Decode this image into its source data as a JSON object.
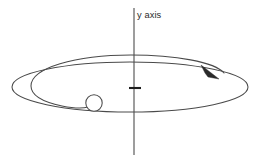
{
  "figure": {
    "background_color": "#ffffff",
    "width": 261,
    "height": 160,
    "labels": {
      "y_axis": "y axis"
    },
    "colors": {
      "axis": "#555555",
      "orbit": "#4a4a4a",
      "arrow": "#2a2a2a",
      "tick": "#1d1d1d",
      "ball_fill": "#ffffff",
      "text": "#2b2b2b"
    },
    "elements": {
      "y_axis_line": {
        "name": "y axis",
        "x": 134,
        "y_top": 8,
        "y_bottom": 155
      },
      "origin_tick": {
        "name": "origin tick mark",
        "x_start": 129,
        "x_end": 141,
        "y": 88
      },
      "outer_orbit": {
        "name": "outer orbit ellipse",
        "center_x": 130,
        "center_y": 87,
        "radius_x": 118,
        "radius_y": 25
      },
      "inner_orbit": {
        "name": "inner spiral orbit",
        "center_x": 131,
        "center_y": 86,
        "radius_x": 100,
        "radius_y": 19
      },
      "ball": {
        "name": "orbiting ball",
        "center_x": 94,
        "center_y": 103,
        "radius": 8.2
      },
      "direction_arrow": {
        "name": "direction of motion arrowhead",
        "tip_x": 219,
        "tip_y": 78,
        "direction": "clockwise-when-viewed-from-above"
      }
    }
  }
}
